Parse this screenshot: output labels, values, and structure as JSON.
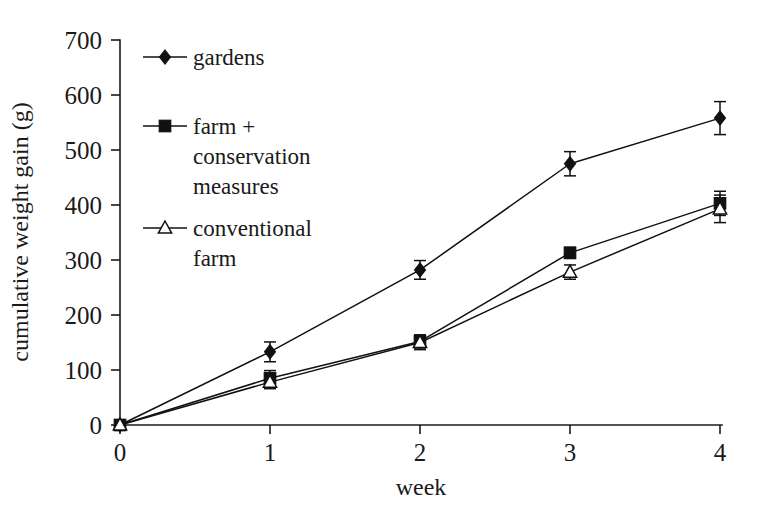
{
  "chart_data": {
    "type": "line",
    "title": "",
    "xlabel": "week",
    "ylabel": "cumulative weight gain (g)",
    "x": [
      0,
      1,
      2,
      3,
      4
    ],
    "xticklabels": [
      "0",
      "1",
      "2",
      "3",
      "4"
    ],
    "yticklabels": [
      "0",
      "100",
      "200",
      "300",
      "400",
      "500",
      "600",
      "700"
    ],
    "yticks": [
      0,
      100,
      200,
      300,
      400,
      500,
      600,
      700
    ],
    "xlim": [
      0,
      4
    ],
    "ylim": [
      0,
      700
    ],
    "grid": false,
    "legend_position": "upper-left-inside",
    "series": [
      {
        "name": "gardens",
        "marker": "filled-diamond",
        "color": "#111111",
        "values": [
          0,
          133,
          282,
          475,
          558
        ],
        "errors": [
          0,
          18,
          17,
          22,
          30
        ]
      },
      {
        "name": "farm + conservation measures",
        "marker": "filled-square",
        "color": "#111111",
        "values": [
          0,
          85,
          152,
          313,
          403
        ],
        "errors": [
          0,
          14,
          12,
          10,
          22
        ]
      },
      {
        "name": "conventional farm",
        "marker": "open-triangle",
        "color": "#111111",
        "values": [
          0,
          78,
          150,
          278,
          393
        ],
        "errors": [
          0,
          12,
          13,
          13,
          25
        ]
      }
    ]
  },
  "legend": {
    "entries": [
      {
        "label": "gardens",
        "marker": "filled-diamond"
      },
      {
        "label": "farm +",
        "marker": "filled-square"
      },
      {
        "label": "conservation",
        "marker": "none"
      },
      {
        "label": "measures",
        "marker": "none"
      },
      {
        "label": "conventional",
        "marker": "open-triangle"
      },
      {
        "label": "farm",
        "marker": "none"
      }
    ]
  },
  "axes": {
    "x_title": "week",
    "y_title": "cumulative weight gain (g)"
  }
}
